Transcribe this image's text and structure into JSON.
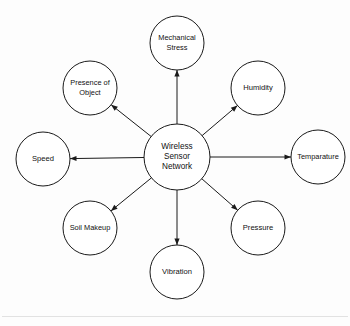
{
  "diagram": {
    "type": "hub-and-spoke",
    "center": {
      "id": "wireless-sensor-network",
      "label_lines": [
        "Wireless",
        "Sensor",
        "Network"
      ],
      "label": "Wireless Sensor Network",
      "cx": 177,
      "cy": 157,
      "r": 33
    },
    "nodes": [
      {
        "id": "mechanical-stress",
        "label": "Mechanical Stress",
        "label_lines": [
          "Mechanical",
          "Stress"
        ],
        "cx": 177,
        "cy": 43,
        "r": 27,
        "angle_deg": 270,
        "arrow": "outward"
      },
      {
        "id": "humidity",
        "label": "Humidity",
        "label_lines": [
          "Humidity"
        ],
        "cx": 258,
        "cy": 88,
        "r": 27,
        "angle_deg": 319,
        "arrow": "outward"
      },
      {
        "id": "temparature",
        "label": "Temparature",
        "label_lines": [
          "Temparature"
        ],
        "cx": 318,
        "cy": 157,
        "r": 27,
        "angle_deg": 0,
        "arrow": "outward"
      },
      {
        "id": "pressure",
        "label": "Pressure",
        "label_lines": [
          "Pressure"
        ],
        "cx": 258,
        "cy": 228,
        "r": 27,
        "angle_deg": 41,
        "arrow": "outward"
      },
      {
        "id": "vibration",
        "label": "Vibration",
        "label_lines": [
          "Vibration"
        ],
        "cx": 177,
        "cy": 272,
        "r": 27,
        "angle_deg": 90,
        "arrow": "outward"
      },
      {
        "id": "soil-makeup",
        "label": "Soil Makeup",
        "label_lines": [
          "Soil Makeup"
        ],
        "cx": 90,
        "cy": 228,
        "r": 27,
        "angle_deg": 141,
        "arrow": "outward"
      },
      {
        "id": "speed",
        "label": "Speed",
        "label_lines": [
          "Speed"
        ],
        "cx": 43,
        "cy": 159,
        "r": 27,
        "angle_deg": 180,
        "arrow": "outward"
      },
      {
        "id": "presence-of-object",
        "label": "Presence of Object",
        "label_lines": [
          "Presence of",
          "Object"
        ],
        "cx": 90,
        "cy": 88,
        "r": 27,
        "angle_deg": 215,
        "arrow": "outward"
      }
    ],
    "colors": {
      "stroke": "#1a1a1a",
      "fill": "#ffffff",
      "text": "#111111",
      "background": "#fdfdfd",
      "rule": "#e2e2e2"
    }
  }
}
